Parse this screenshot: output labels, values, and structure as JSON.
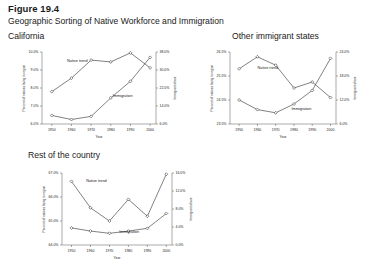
{
  "figure": {
    "number": "Figure 19.4",
    "title": "Geographic Sorting of Native Workforce and Immigration"
  },
  "panels": [
    {
      "key": "california",
      "title": "California"
    },
    {
      "key": "other_states",
      "title": "Other immigrant states"
    },
    {
      "key": "rest_country",
      "title": "Rest of the country"
    }
  ],
  "labels": {
    "native": "Native trend",
    "immigration": "Immigration",
    "xlabel": "Year",
    "ylabel_left": "Percent of natives living in region",
    "ylabel_right": "Immigrant share"
  },
  "chart_data": [
    {
      "type": "line",
      "title": "California",
      "xlabel": "Year",
      "ylabel": "Percent of natives living in region",
      "ylabel_right": "Immigrant share",
      "x": [
        1950,
        1960,
        1970,
        1980,
        1990,
        2000
      ],
      "xlim": [
        1945,
        2003
      ],
      "ylim": [
        6.0,
        10.0
      ],
      "yticks": [
        "6.0%",
        "7.0%",
        "8.0%",
        "9.0%",
        "10.0%"
      ],
      "ylim_right": [
        6.0,
        38.0
      ],
      "yticks_right": [
        "6.0%",
        "14.0%",
        "22.0%",
        "30.0%",
        "38.0%"
      ],
      "grid": false,
      "legend": "inline-annotation",
      "series": [
        {
          "name": "Native trend",
          "axis": "left",
          "values": [
            7.8,
            8.55,
            9.55,
            9.45,
            9.95,
            9.12
          ]
        },
        {
          "name": "Immigration",
          "axis": "right",
          "values": [
            9.8,
            8.0,
            9.4,
            17.6,
            25.0,
            35.6
          ]
        }
      ]
    },
    {
      "type": "line",
      "title": "Other immigrant states",
      "xlabel": "Year",
      "ylabel": "Percent of natives living in region",
      "ylabel_right": "Immigrant share",
      "x": [
        1950,
        1960,
        1970,
        1980,
        1990,
        2000
      ],
      "xlim": [
        1945,
        2003
      ],
      "ylim": [
        23.5,
        26.5
      ],
      "yticks": [
        "23.5%",
        "24.5%",
        "25.5%",
        "26.5%"
      ],
      "ylim_right": [
        6.0,
        24.0
      ],
      "yticks_right": [
        "6.0%",
        "12.0%",
        "18.0%",
        "24.0%"
      ],
      "grid": false,
      "legend": "inline-annotation",
      "series": [
        {
          "name": "Native trend",
          "axis": "left",
          "values": [
            25.8,
            26.3,
            25.95,
            25.0,
            25.25,
            24.6
          ]
        },
        {
          "name": "Immigration",
          "axis": "right",
          "values": [
            12.0,
            9.6,
            8.8,
            11.0,
            14.4,
            22.4
          ]
        }
      ]
    },
    {
      "type": "line",
      "title": "Rest of the country",
      "xlabel": "Year",
      "ylabel": "Percent of natives living in region",
      "ylabel_right": "Immigrant share",
      "x": [
        1950,
        1960,
        1970,
        1980,
        1990,
        2000
      ],
      "xlim": [
        1945,
        2003
      ],
      "ylim": [
        64.0,
        67.0
      ],
      "yticks": [
        "64.0%",
        "65.0%",
        "66.0%",
        "67.0%"
      ],
      "ylim_right": [
        0.0,
        16.0
      ],
      "yticks_right": [
        "0.0%",
        "4.0%",
        "8.0%",
        "12.0%",
        "16.0%"
      ],
      "grid": false,
      "legend": "inline-annotation",
      "series": [
        {
          "name": "Native trend",
          "axis": "left",
          "values": [
            66.65,
            65.55,
            65.0,
            65.9,
            65.2,
            66.95
          ]
        },
        {
          "name": "Immigration",
          "axis": "right",
          "values": [
            3.8,
            3.1,
            2.6,
            3.1,
            3.7,
            7.0
          ]
        }
      ]
    }
  ]
}
